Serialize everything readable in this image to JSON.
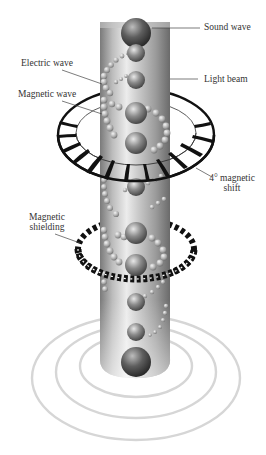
{
  "diagram": {
    "labels": {
      "sound_wave": "Sound wave",
      "light_beam": "Light beam",
      "electric_wave": "Electric wave",
      "magnetic_wave": "Magnetic wave",
      "magnetic_shift_line1": "4° magnetic",
      "magnetic_shift_line2": "shift",
      "magnetic_shielding_line1": "Magnetic",
      "magnetic_shielding_line2": "shielding"
    },
    "components": [
      "light-beam-column",
      "sound-wave-spheres",
      "electric-wave-helix",
      "magnetic-wave-helix",
      "magnetic-shift-ring",
      "magnetic-shielding-coil",
      "sound-ripples"
    ],
    "colors": {
      "column_dark": "#6e6e6e",
      "column_light": "#e6e6e6",
      "sphere": "#7a7a7a",
      "ring": "#111111",
      "ripple": "#d4d4d4",
      "text": "#333333",
      "leader_line": "#444444"
    }
  }
}
